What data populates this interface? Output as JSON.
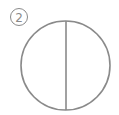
{
  "figure": {
    "label": "2",
    "label_style": "circled-number",
    "shape": "circle",
    "division": "vertical-diameter",
    "stroke_color": "#8a8a8a",
    "background": "#ffffff"
  }
}
